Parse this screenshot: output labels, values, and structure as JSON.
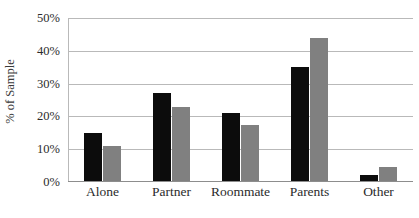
{
  "chart_data": {
    "type": "bar",
    "title": "",
    "xlabel": "",
    "ylabel": "% of Sample",
    "categories": [
      "Alone",
      "Partner",
      "Roommate",
      "Parents",
      "Other"
    ],
    "series": [
      {
        "name": "series-1",
        "color": "#0c0c0c",
        "values": [
          15.0,
          27.0,
          21.0,
          35.0,
          2.0
        ]
      },
      {
        "name": "series-2",
        "color": "#808080",
        "values": [
          11.0,
          23.0,
          17.5,
          44.0,
          4.5
        ]
      }
    ],
    "ylim": [
      0,
      50
    ],
    "yticks": [
      0,
      10,
      20,
      30,
      40,
      50
    ],
    "ytick_labels": [
      "0%",
      "10%",
      "20%",
      "30%",
      "40%",
      "50%"
    ],
    "grid": true,
    "legend": false,
    "legend_position": "none"
  }
}
